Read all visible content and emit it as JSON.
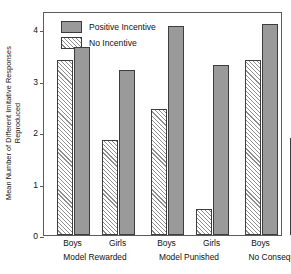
{
  "chart_data": {
    "type": "bar",
    "title": "",
    "xlabel": "",
    "ylabel": "Mean Number of Different Imitative Responses Reproduced",
    "ylabel_lines": [
      "Mean Number of Different Imitative Responses",
      "Reproduced"
    ],
    "ylim": [
      0,
      4.35
    ],
    "yticks": [
      0,
      1,
      2,
      3,
      4
    ],
    "ytick_labels": [
      "0",
      "1",
      "2",
      "3",
      "4"
    ],
    "grid": false,
    "legend_position": "top-left",
    "categories": [
      "Boys",
      "Girls",
      "Boys",
      "Girls",
      "Boys",
      "Girls"
    ],
    "groups": [
      {
        "label": "Model Rewarded",
        "categories": [
          "Boys",
          "Girls"
        ]
      },
      {
        "label": "Model Punished",
        "categories": [
          "Boys",
          "Girls"
        ]
      },
      {
        "label": "No Consequences",
        "categories": [
          "Boys",
          "Girls"
        ]
      }
    ],
    "series": [
      {
        "name": "No Incentive",
        "style": "hatch",
        "color": "#ffffff",
        "hatch_color": "#8e8e8e",
        "values": [
          3.4,
          1.85,
          2.45,
          0.5,
          3.4,
          1.88
        ]
      },
      {
        "name": "Positive Incentive",
        "style": "solid",
        "color": "#9a9a9a",
        "values": [
          3.65,
          3.2,
          4.05,
          3.3,
          4.1,
          3.05
        ]
      }
    ],
    "legend": [
      {
        "label": "Positive Incentive",
        "swatch": "solid"
      },
      {
        "label": "No Incentive",
        "swatch": "hatch"
      }
    ]
  },
  "colors": {
    "solid_fill": "#9a9a9a",
    "hatch_line": "#8e8e8e",
    "bar_border": "#3d3d3d",
    "axis": "#5b5b5b",
    "text": "#111111",
    "background": "#ffffff"
  }
}
